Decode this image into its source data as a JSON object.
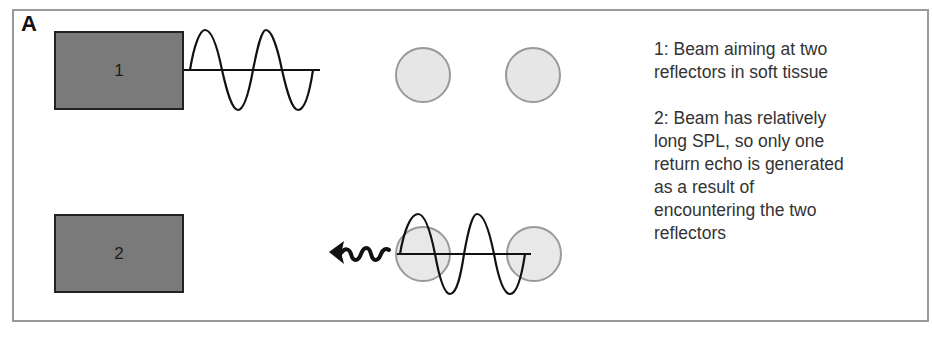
{
  "figure": {
    "panel_label": "A",
    "transducers": [
      {
        "id": "1",
        "label": "1"
      },
      {
        "id": "2",
        "label": "2"
      }
    ],
    "reflectors_per_row": 2,
    "captions": [
      {
        "lines": [
          "1: Beam aiming at two",
          "reflectors in soft tissue"
        ]
      },
      {
        "lines": [
          "2: Beam has relatively",
          "long SPL, so only one",
          "return echo is generated",
          "as a result of",
          "encountering the two",
          "reflectors"
        ]
      }
    ],
    "icons": {
      "echo": "wavy-arrow-left"
    },
    "colors": {
      "transducer_fill": "#7a7a7a",
      "reflector_fill": "#e6e6e6",
      "reflector_stroke": "#999999",
      "wave_stroke": "#111111",
      "frame": "#9a9a9a"
    }
  }
}
